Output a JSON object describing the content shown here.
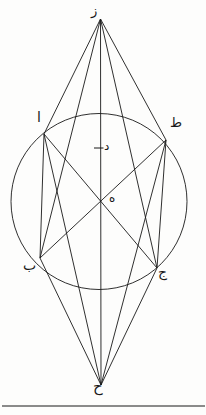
{
  "figure": {
    "background_color": "#fdfdfc",
    "ink_color": "#181818",
    "stroke_width": 0.9
  },
  "labels": {
    "apex_top": "ز",
    "apex_bottom": "ح",
    "upper_left": "ا",
    "upper_right": "ط",
    "lower_left": "ب",
    "lower_right": "ج",
    "diameter_point": "د",
    "center": "ه"
  },
  "geometry": {
    "circle": {
      "cx": 99,
      "cy": 201.5,
      "r": 88
    },
    "points": {
      "z": {
        "x": 100.5,
        "y": 19
      },
      "h": {
        "x": 101,
        "y": 385
      },
      "a": {
        "x": 44,
        "y": 134
      },
      "t": {
        "x": 166,
        "y": 140
      },
      "b": {
        "x": 40,
        "y": 258
      },
      "j": {
        "x": 157,
        "y": 268
      },
      "d": {
        "x": 99,
        "y": 148
      },
      "e": {
        "x": 99,
        "y": 201.5
      }
    },
    "segments": [
      {
        "name": "z-a",
        "from": "z",
        "to": "a"
      },
      {
        "name": "z-t",
        "from": "z",
        "to": "t"
      },
      {
        "name": "z-b",
        "from": "z",
        "to": "b"
      },
      {
        "name": "z-j",
        "from": "z",
        "to": "j"
      },
      {
        "name": "z-h",
        "from": "z",
        "to": "h"
      },
      {
        "name": "h-a",
        "from": "h",
        "to": "a"
      },
      {
        "name": "h-t",
        "from": "h",
        "to": "t"
      },
      {
        "name": "h-b",
        "from": "h",
        "to": "b"
      },
      {
        "name": "h-j",
        "from": "h",
        "to": "j"
      },
      {
        "name": "a-b",
        "from": "a",
        "to": "b"
      },
      {
        "name": "t-j",
        "from": "t",
        "to": "j"
      },
      {
        "name": "a-j",
        "from": "a",
        "to": "j"
      },
      {
        "name": "b-t",
        "from": "b",
        "to": "t"
      }
    ],
    "tick": {
      "x1": 94,
      "y1": 148,
      "x2": 103,
      "y2": 148
    },
    "baseline_rule": {
      "x1": 2,
      "y1": 406,
      "x2": 205,
      "y2": 406
    }
  }
}
